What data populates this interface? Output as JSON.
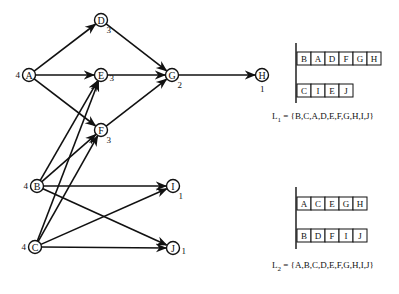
{
  "graph": {
    "nodes": [
      {
        "id": "A",
        "x": 29,
        "y": 75,
        "weight": "4",
        "weight_pos": "left"
      },
      {
        "id": "B",
        "x": 37,
        "y": 186,
        "weight": "4",
        "weight_pos": "left"
      },
      {
        "id": "C",
        "x": 35,
        "y": 247,
        "weight": "4",
        "weight_pos": "left"
      },
      {
        "id": "D",
        "x": 101,
        "y": 20,
        "weight": "3",
        "weight_pos": "below-right"
      },
      {
        "id": "E",
        "x": 101,
        "y": 75,
        "weight": "3",
        "weight_pos": "right"
      },
      {
        "id": "F",
        "x": 101,
        "y": 130,
        "weight": "3",
        "weight_pos": "below-right"
      },
      {
        "id": "G",
        "x": 172,
        "y": 75,
        "weight": "2",
        "weight_pos": "below-right"
      },
      {
        "id": "H",
        "x": 262,
        "y": 75,
        "weight": "1",
        "weight_pos": "below"
      },
      {
        "id": "I",
        "x": 173,
        "y": 186,
        "weight": "1",
        "weight_pos": "below-right"
      },
      {
        "id": "J",
        "x": 173,
        "y": 248,
        "weight": "1",
        "weight_pos": "right"
      }
    ],
    "edges": [
      [
        "A",
        "D"
      ],
      [
        "A",
        "E"
      ],
      [
        "A",
        "F"
      ],
      [
        "B",
        "E"
      ],
      [
        "B",
        "F"
      ],
      [
        "B",
        "I"
      ],
      [
        "B",
        "J"
      ],
      [
        "C",
        "E"
      ],
      [
        "C",
        "F"
      ],
      [
        "C",
        "I"
      ],
      [
        "C",
        "J"
      ],
      [
        "D",
        "G"
      ],
      [
        "E",
        "G"
      ],
      [
        "F",
        "G"
      ],
      [
        "G",
        "H"
      ]
    ]
  },
  "lists": [
    {
      "name": "L1",
      "spine": {
        "x": 296,
        "y1": 43,
        "y2": 103
      },
      "rows": [
        {
          "y": 52,
          "cells": [
            "B",
            "A",
            "D",
            "F",
            "G",
            "H"
          ]
        },
        {
          "y": 84,
          "cells": [
            "C",
            "I",
            "E",
            "J"
          ]
        }
      ],
      "formula": {
        "label": "L",
        "subscript": "1",
        "text": " = {B,C,A,D,E,F,G,H,I,J}",
        "x": 272,
        "y": 113
      }
    },
    {
      "name": "L2",
      "spine": {
        "x": 296,
        "y1": 187,
        "y2": 249
      },
      "rows": [
        {
          "y": 197,
          "cells": [
            "A",
            "C",
            "E",
            "G",
            "H"
          ]
        },
        {
          "y": 229,
          "cells": [
            "B",
            "D",
            "F",
            "I",
            "J"
          ]
        }
      ],
      "formula": {
        "label": "L",
        "subscript": "2",
        "text": " = {A,B,C,D,E,F,G,H,I,J}",
        "x": 272,
        "y": 262
      }
    }
  ],
  "layout": {
    "box_w": 14,
    "box_h": 13,
    "node_r": 6.5
  }
}
